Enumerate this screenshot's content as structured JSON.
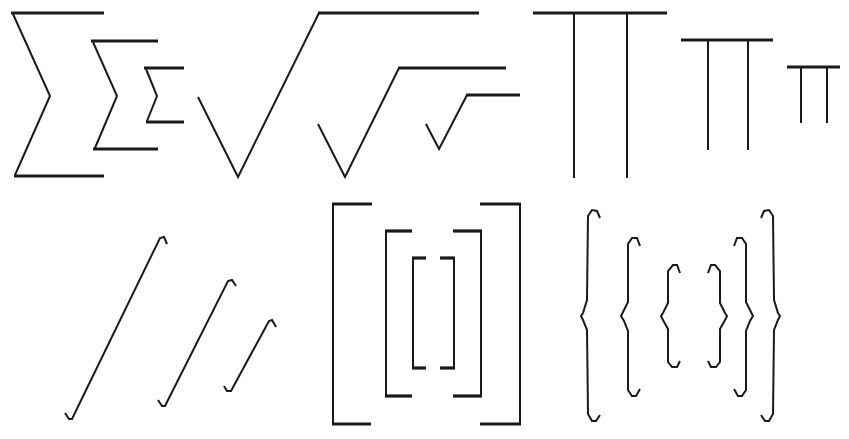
{
  "stroke_color": "#1a1a1a",
  "background": "#ffffff",
  "rows": [
    {
      "name": "operators",
      "groups": [
        {
          "symbol": "summation",
          "glyph": "∑",
          "sizes": [
            "large",
            "medium",
            "small"
          ]
        },
        {
          "symbol": "square-root",
          "glyph": "√",
          "sizes": [
            "large",
            "medium",
            "small"
          ]
        },
        {
          "symbol": "product",
          "glyph": "∏",
          "sizes": [
            "large",
            "medium",
            "small"
          ]
        }
      ]
    },
    {
      "name": "delimiters",
      "groups": [
        {
          "symbol": "integral",
          "glyph": "∫",
          "sizes": [
            "large",
            "medium",
            "small"
          ]
        },
        {
          "symbol": "square-brackets",
          "glyph": "[ ]",
          "sizes": [
            "large",
            "medium",
            "small"
          ]
        },
        {
          "symbol": "curly-braces",
          "glyph": "{ }",
          "sizes": [
            "large",
            "medium",
            "small"
          ]
        }
      ]
    }
  ]
}
